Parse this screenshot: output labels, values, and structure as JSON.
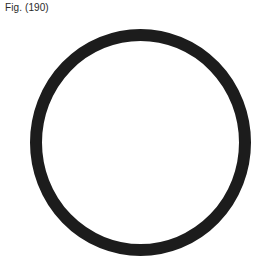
{
  "figure": {
    "label": "Fig. (190)",
    "shape": "ring",
    "ring": {
      "cx": 140.5,
      "cy": 142.5,
      "rx": 104.5,
      "ry": 107.5,
      "stroke_width": 12,
      "color": "#1c1c1c"
    }
  }
}
